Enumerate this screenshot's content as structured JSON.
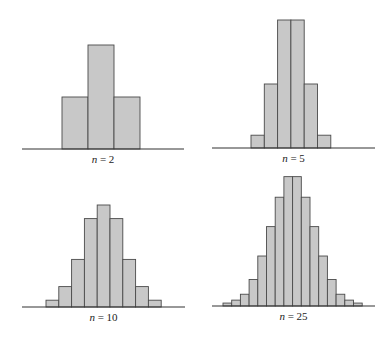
{
  "chart_data": [
    {
      "type": "bar",
      "title": "n = 2",
      "label": {
        "var": "n",
        "eq": " = ",
        "value": "2"
      },
      "categories": [
        "1",
        "2",
        "3"
      ],
      "values": [
        1,
        2,
        1
      ],
      "xlabel": "",
      "ylabel": "",
      "grid": false,
      "geometry": {
        "baseline_y": 149,
        "axis_x": [
          22,
          184
        ],
        "bar_x0": 62,
        "bar_w": 26,
        "unit_px": 52,
        "label_y": 153
      }
    },
    {
      "type": "bar",
      "title": "n = 5",
      "label": {
        "var": "n",
        "eq": " = ",
        "value": "5"
      },
      "categories": [
        "1",
        "2",
        "3",
        "4",
        "5",
        "6"
      ],
      "values": [
        1,
        5,
        10,
        10,
        5,
        1
      ],
      "xlabel": "",
      "ylabel": "",
      "grid": false,
      "geometry": {
        "baseline_y": 148,
        "axis_x": [
          212,
          375
        ],
        "bar_x0": 251,
        "bar_w": 13.3,
        "unit_px": 12.8,
        "label_y": 152
      }
    },
    {
      "type": "bar",
      "title": "n = 10",
      "label": {
        "var": "n",
        "eq": " = ",
        "value": "10"
      },
      "categories": [
        "1",
        "2",
        "3",
        "4",
        "5",
        "6",
        "7",
        "8",
        "9"
      ],
      "values": [
        1,
        3,
        7,
        13,
        15,
        13,
        7,
        3,
        1
      ],
      "xlabel": "",
      "ylabel": "",
      "grid": false,
      "geometry": {
        "baseline_y": 307,
        "axis_x": [
          22,
          185
        ],
        "bar_x0": 46,
        "bar_w": 12.8,
        "unit_px": 6.8,
        "label_y": 311
      }
    },
    {
      "type": "bar",
      "title": "n = 25",
      "label": {
        "var": "n",
        "eq": " = ",
        "value": "25"
      },
      "categories": [
        "1",
        "2",
        "3",
        "4",
        "5",
        "6",
        "7",
        "8",
        "9",
        "10",
        "11",
        "12",
        "13",
        "14",
        "15",
        "16"
      ],
      "values": [
        1,
        2,
        4,
        9,
        17,
        27,
        37,
        44,
        44,
        37,
        27,
        17,
        9,
        4,
        2,
        1
      ],
      "xlabel": "",
      "ylabel": "",
      "grid": false,
      "geometry": {
        "baseline_y": 306,
        "axis_x": [
          212,
          375
        ],
        "bar_x0": 223,
        "bar_w": 8.7,
        "unit_px": 2.94,
        "label_y": 310
      }
    }
  ]
}
